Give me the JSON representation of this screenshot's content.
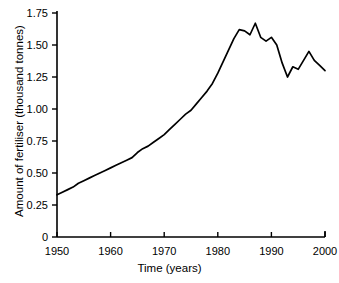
{
  "chart_data": {
    "type": "line",
    "title": "",
    "xlabel": "Time (years)",
    "ylabel": "Amount of fertiliser (thousand tonnes)",
    "xlim": [
      1950,
      2000
    ],
    "ylim": [
      0,
      1.75
    ],
    "grid": false,
    "legend": null,
    "xticks": [
      "1950",
      "1960",
      "1970",
      "1980",
      "1990",
      "2000"
    ],
    "xtick_values": [
      1950,
      1960,
      1970,
      1980,
      1990,
      2000
    ],
    "yticks": [
      "0",
      "0.25",
      "0.50",
      "0.75",
      "1.00",
      "1.25",
      "1.50",
      "1.75"
    ],
    "ytick_values": [
      0,
      0.25,
      0.5,
      0.75,
      1.0,
      1.25,
      1.5,
      1.75
    ],
    "line_color": "#000000",
    "axis_color": "#000000",
    "x": [
      1950,
      1951,
      1952,
      1953,
      1954,
      1955,
      1956,
      1957,
      1958,
      1959,
      1960,
      1961,
      1962,
      1963,
      1964,
      1965,
      1966,
      1967,
      1968,
      1969,
      1970,
      1971,
      1972,
      1973,
      1974,
      1975,
      1976,
      1977,
      1978,
      1979,
      1980,
      1981,
      1982,
      1983,
      1984,
      1985,
      1986,
      1987,
      1988,
      1989,
      1990,
      1991,
      1992,
      1993,
      1994,
      1995,
      1996,
      1997,
      1998,
      1999,
      2000
    ],
    "values": [
      0.33,
      0.35,
      0.37,
      0.39,
      0.42,
      0.44,
      0.46,
      0.48,
      0.5,
      0.52,
      0.54,
      0.56,
      0.58,
      0.6,
      0.62,
      0.66,
      0.69,
      0.71,
      0.74,
      0.77,
      0.8,
      0.84,
      0.88,
      0.92,
      0.96,
      0.99,
      1.04,
      1.09,
      1.14,
      1.2,
      1.28,
      1.37,
      1.46,
      1.55,
      1.62,
      1.61,
      1.58,
      1.67,
      1.56,
      1.53,
      1.56,
      1.5,
      1.36,
      1.25,
      1.33,
      1.31,
      1.38,
      1.45,
      1.38,
      1.34,
      1.3
    ],
    "series": [
      {
        "name": "Amount of fertiliser",
        "values": [
          0.33,
          0.35,
          0.37,
          0.39,
          0.42,
          0.44,
          0.46,
          0.48,
          0.5,
          0.52,
          0.54,
          0.56,
          0.58,
          0.6,
          0.62,
          0.66,
          0.69,
          0.71,
          0.74,
          0.77,
          0.8,
          0.84,
          0.88,
          0.92,
          0.96,
          0.99,
          1.04,
          1.09,
          1.14,
          1.2,
          1.28,
          1.37,
          1.46,
          1.55,
          1.62,
          1.61,
          1.58,
          1.67,
          1.56,
          1.53,
          1.56,
          1.5,
          1.36,
          1.25,
          1.33,
          1.31,
          1.38,
          1.45,
          1.38,
          1.34,
          1.3
        ]
      }
    ]
  },
  "axes": {
    "x_title": "Time (years)",
    "y_title": "Amount of fertiliser (thousand tonnes)"
  }
}
